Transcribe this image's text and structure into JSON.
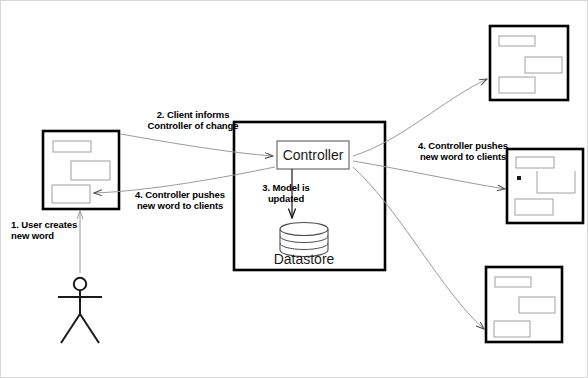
{
  "diagram": {
    "colors": {
      "stroke_strong": "#000000",
      "stroke_light": "#9a9a9a",
      "inner_box": "#8d8d8d",
      "canvas_border": "#d8d8d8",
      "background": "#ffffff",
      "text": "#000000",
      "node_text": "#1a1a1a"
    },
    "nodes": {
      "controller": {
        "label": "Controller",
        "name": "controller-node"
      },
      "datastore": {
        "label": "Datastore",
        "name": "datastore-node"
      },
      "user": {
        "name": "user-stick-figure"
      },
      "server_box": {
        "name": "server-container"
      }
    },
    "clients": [
      {
        "id": "client-left",
        "position": "left",
        "name": "client-window-left"
      },
      {
        "id": "client-top-right",
        "position": "top-right",
        "name": "client-window-top-right"
      },
      {
        "id": "client-mid-right",
        "position": "middle-right",
        "name": "client-window-middle-right"
      },
      {
        "id": "client-bottom-right",
        "position": "bottom-right",
        "name": "client-window-bottom-right"
      }
    ],
    "steps": [
      {
        "id": "step-1",
        "number": "1.",
        "line1": "1. User creates",
        "line2": "new word",
        "text": "1. User creates\nnew word",
        "align": "left"
      },
      {
        "id": "step-2",
        "number": "2.",
        "line1": "2. Client informs",
        "line2": "Controller of change",
        "text": "2. Client informs\nController of change",
        "align": "center"
      },
      {
        "id": "step-3",
        "number": "3.",
        "line1": "3. Model is",
        "line2": "updated",
        "text": "3. Model is\nupdated",
        "align": "center"
      },
      {
        "id": "step-4-left",
        "number": "4.",
        "line1": "4. Controller pushes",
        "line2": "new word to clients",
        "text": "4. Controller pushes\nnew word to clients",
        "align": "center"
      },
      {
        "id": "step-4-right",
        "number": "4.",
        "line1": "4. Controller pushes",
        "line2": "new word to clients",
        "text": "4. Controller pushes\nnew word to clients",
        "align": "center"
      }
    ]
  }
}
